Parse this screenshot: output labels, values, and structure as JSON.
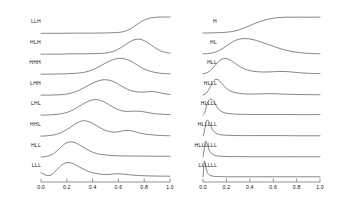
{
  "figure": {
    "background": "#ffffff",
    "line_color": "#3c3c3c",
    "axis_color": "#4a4a4a",
    "text_color": "#111111"
  },
  "chart_data": {
    "type": "line",
    "title": "",
    "xlabel": "",
    "ylabel": "",
    "grid": false,
    "legend": "none",
    "xlim": [
      0.0,
      1.0
    ],
    "panels": [
      {
        "name": "left-panel",
        "axis": {
          "xlim": [
            0.0,
            1.0
          ],
          "ticks": [
            0.0,
            0.2,
            0.4,
            0.6,
            0.8,
            1.0
          ],
          "tick_labels": [
            "0.0",
            "0.2",
            "0.4",
            "0.6",
            "0.8",
            "1.0"
          ]
        },
        "series": [
          {
            "name": "LLH",
            "label": "LLH",
            "peak_x": 0.83,
            "shape": "sigmoid-rise",
            "x": [
              0.0,
              0.05,
              0.1,
              0.15,
              0.2,
              0.25,
              0.3,
              0.35,
              0.4,
              0.45,
              0.5,
              0.55,
              0.6,
              0.63,
              0.66,
              0.69,
              0.72,
              0.75,
              0.78,
              0.81,
              0.84,
              0.87,
              0.9,
              0.95,
              1.0
            ],
            "y": [
              0.04,
              0.04,
              0.04,
              0.04,
              0.045,
              0.05,
              0.05,
              0.05,
              0.05,
              0.055,
              0.06,
              0.07,
              0.09,
              0.12,
              0.18,
              0.28,
              0.42,
              0.58,
              0.72,
              0.83,
              0.9,
              0.94,
              0.96,
              0.97,
              0.97
            ]
          },
          {
            "name": "HLH",
            "label": "HLH",
            "peak_x": 0.76,
            "shape": "broad-peak",
            "x": [
              0.0,
              0.05,
              0.1,
              0.15,
              0.2,
              0.25,
              0.3,
              0.35,
              0.4,
              0.45,
              0.5,
              0.55,
              0.58,
              0.62,
              0.66,
              0.7,
              0.74,
              0.78,
              0.82,
              0.86,
              0.9,
              0.94,
              1.0
            ],
            "y": [
              0.05,
              0.05,
              0.05,
              0.05,
              0.06,
              0.07,
              0.07,
              0.07,
              0.08,
              0.09,
              0.11,
              0.18,
              0.26,
              0.42,
              0.62,
              0.8,
              0.9,
              0.88,
              0.74,
              0.54,
              0.34,
              0.2,
              0.1
            ]
          },
          {
            "name": "HHH",
            "label": "HHH",
            "peak_x": 0.64,
            "shape": "broad-peak-with-shoulder",
            "x": [
              0.0,
              0.05,
              0.1,
              0.15,
              0.2,
              0.25,
              0.3,
              0.34,
              0.38,
              0.42,
              0.46,
              0.5,
              0.54,
              0.58,
              0.62,
              0.66,
              0.7,
              0.74,
              0.78,
              0.82,
              0.88,
              0.94,
              1.0
            ],
            "y": [
              0.05,
              0.05,
              0.055,
              0.06,
              0.07,
              0.09,
              0.12,
              0.16,
              0.24,
              0.36,
              0.52,
              0.68,
              0.82,
              0.92,
              0.95,
              0.9,
              0.78,
              0.6,
              0.42,
              0.28,
              0.15,
              0.09,
              0.07
            ]
          },
          {
            "name": "LHH",
            "label": "LHH",
            "peak_x": 0.5,
            "shape": "peak-plus-bump",
            "x": [
              0.0,
              0.05,
              0.1,
              0.14,
              0.18,
              0.22,
              0.26,
              0.3,
              0.34,
              0.38,
              0.42,
              0.46,
              0.5,
              0.54,
              0.58,
              0.62,
              0.66,
              0.7,
              0.74,
              0.78,
              0.82,
              0.86,
              0.9,
              0.95,
              1.0
            ],
            "y": [
              0.05,
              0.05,
              0.06,
              0.07,
              0.09,
              0.14,
              0.22,
              0.34,
              0.5,
              0.66,
              0.8,
              0.9,
              0.93,
              0.88,
              0.76,
              0.58,
              0.42,
              0.3,
              0.24,
              0.22,
              0.24,
              0.26,
              0.22,
              0.14,
              0.09
            ]
          },
          {
            "name": "LHL",
            "label": "LHL",
            "peak_x": 0.42,
            "shape": "peak-plus-bump",
            "x": [
              0.0,
              0.04,
              0.08,
              0.12,
              0.16,
              0.2,
              0.24,
              0.28,
              0.32,
              0.36,
              0.4,
              0.44,
              0.48,
              0.52,
              0.56,
              0.6,
              0.64,
              0.68,
              0.72,
              0.78,
              0.84,
              0.9,
              1.0
            ],
            "y": [
              0.05,
              0.055,
              0.07,
              0.09,
              0.13,
              0.2,
              0.32,
              0.48,
              0.66,
              0.82,
              0.92,
              0.93,
              0.84,
              0.68,
              0.5,
              0.36,
              0.28,
              0.26,
              0.28,
              0.26,
              0.18,
              0.12,
              0.08
            ]
          },
          {
            "name": "HHL",
            "label": "HHL",
            "peak_x": 0.33,
            "shape": "peak-plus-two-bumps",
            "x": [
              0.0,
              0.03,
              0.06,
              0.1,
              0.14,
              0.18,
              0.22,
              0.26,
              0.3,
              0.33,
              0.36,
              0.4,
              0.44,
              0.48,
              0.52,
              0.56,
              0.6,
              0.64,
              0.68,
              0.72,
              0.78,
              0.85,
              0.92,
              1.0
            ],
            "y": [
              0.05,
              0.06,
              0.08,
              0.12,
              0.2,
              0.34,
              0.52,
              0.72,
              0.88,
              0.93,
              0.9,
              0.78,
              0.6,
              0.44,
              0.33,
              0.28,
              0.3,
              0.36,
              0.38,
              0.32,
              0.2,
              0.13,
              0.09,
              0.07
            ]
          },
          {
            "name": "HLL",
            "label": "HLL",
            "peak_x": 0.22,
            "shape": "early-peak",
            "x": [
              0.0,
              0.03,
              0.06,
              0.09,
              0.12,
              0.15,
              0.18,
              0.21,
              0.24,
              0.27,
              0.3,
              0.34,
              0.38,
              0.42,
              0.46,
              0.52,
              0.58,
              0.64,
              0.72,
              0.8,
              0.9,
              1.0
            ],
            "y": [
              0.06,
              0.08,
              0.13,
              0.22,
              0.38,
              0.58,
              0.78,
              0.9,
              0.92,
              0.86,
              0.74,
              0.56,
              0.4,
              0.28,
              0.21,
              0.16,
              0.13,
              0.12,
              0.11,
              0.11,
              0.1,
              0.1
            ]
          },
          {
            "name": "LLL",
            "label": "LLL",
            "peak_x": 0.18,
            "shape": "dip-then-peak",
            "x": [
              0.0,
              0.02,
              0.04,
              0.06,
              0.08,
              0.1,
              0.13,
              0.16,
              0.19,
              0.22,
              0.25,
              0.28,
              0.32,
              0.36,
              0.4,
              0.46,
              0.52,
              0.58,
              0.64,
              0.72,
              0.8,
              0.9,
              1.0
            ],
            "y": [
              0.3,
              0.22,
              0.16,
              0.14,
              0.18,
              0.3,
              0.52,
              0.74,
              0.86,
              0.88,
              0.82,
              0.7,
              0.54,
              0.4,
              0.3,
              0.22,
              0.2,
              0.24,
              0.22,
              0.16,
              0.13,
              0.11,
              0.1
            ]
          }
        ]
      },
      {
        "name": "right-panel",
        "axis": {
          "xlim": [
            0.0,
            1.0
          ],
          "ticks": [
            0.0,
            0.2,
            0.4,
            0.6,
            0.8,
            1.0
          ],
          "tick_labels": [
            "0.0",
            "0.2",
            "0.4",
            "0.6",
            "0.8",
            "1.0"
          ]
        },
        "series": [
          {
            "name": "H",
            "label": "H",
            "peak_x": 0.62,
            "shape": "sigmoid-rise-plateau",
            "x": [
              0.0,
              0.05,
              0.1,
              0.15,
              0.2,
              0.25,
              0.3,
              0.35,
              0.4,
              0.45,
              0.5,
              0.55,
              0.6,
              0.65,
              0.7,
              0.75,
              0.8,
              0.85,
              0.9,
              0.95,
              1.0
            ],
            "y": [
              0.06,
              0.06,
              0.07,
              0.08,
              0.1,
              0.14,
              0.22,
              0.34,
              0.48,
              0.62,
              0.74,
              0.84,
              0.9,
              0.94,
              0.96,
              0.96,
              0.96,
              0.96,
              0.96,
              0.96,
              0.96
            ]
          },
          {
            "name": "HL",
            "label": "HL",
            "peak_x": 0.34,
            "shape": "broad-peak",
            "x": [
              0.0,
              0.04,
              0.08,
              0.12,
              0.16,
              0.2,
              0.24,
              0.28,
              0.32,
              0.36,
              0.4,
              0.44,
              0.48,
              0.54,
              0.6,
              0.66,
              0.72,
              0.78,
              0.85,
              0.92,
              1.0
            ],
            "y": [
              0.06,
              0.08,
              0.12,
              0.2,
              0.34,
              0.52,
              0.7,
              0.84,
              0.92,
              0.94,
              0.92,
              0.86,
              0.78,
              0.64,
              0.5,
              0.36,
              0.26,
              0.18,
              0.12,
              0.09,
              0.07
            ]
          },
          {
            "name": "HLL",
            "label": "HLL",
            "peak_x": 0.19,
            "shape": "peak-plus-bump",
            "x": [
              0.0,
              0.03,
              0.06,
              0.09,
              0.12,
              0.15,
              0.18,
              0.21,
              0.24,
              0.28,
              0.32,
              0.36,
              0.4,
              0.46,
              0.52,
              0.58,
              0.64,
              0.7,
              0.76,
              0.84,
              0.92,
              1.0
            ],
            "y": [
              0.07,
              0.12,
              0.24,
              0.44,
              0.68,
              0.86,
              0.94,
              0.92,
              0.82,
              0.64,
              0.46,
              0.33,
              0.25,
              0.19,
              0.17,
              0.18,
              0.2,
              0.2,
              0.17,
              0.12,
              0.09,
              0.08
            ]
          },
          {
            "name": "HLLL",
            "label": "HLLL",
            "peak_x": 0.12,
            "shape": "sharp-peak",
            "x": [
              0.0,
              0.02,
              0.04,
              0.06,
              0.08,
              0.1,
              0.12,
              0.14,
              0.16,
              0.19,
              0.22,
              0.26,
              0.3,
              0.36,
              0.42,
              0.48,
              0.54,
              0.6,
              0.68,
              0.78,
              0.88,
              1.0
            ],
            "y": [
              0.07,
              0.12,
              0.26,
              0.5,
              0.76,
              0.92,
              0.95,
              0.88,
              0.72,
              0.5,
              0.34,
              0.22,
              0.16,
              0.12,
              0.11,
              0.12,
              0.13,
              0.13,
              0.11,
              0.09,
              0.08,
              0.07
            ]
          },
          {
            "name": "HLLLL",
            "label": "HLLLL",
            "peak_x": 0.07,
            "shape": "very-sharp-peak",
            "x": [
              0.0,
              0.01,
              0.02,
              0.03,
              0.04,
              0.055,
              0.07,
              0.085,
              0.1,
              0.12,
              0.14,
              0.17,
              0.2,
              0.25,
              0.3,
              0.38,
              0.46,
              0.56,
              0.68,
              0.8,
              0.9,
              1.0
            ],
            "y": [
              0.07,
              0.14,
              0.32,
              0.58,
              0.8,
              0.93,
              0.96,
              0.88,
              0.72,
              0.5,
              0.34,
              0.22,
              0.16,
              0.12,
              0.1,
              0.09,
              0.09,
              0.09,
              0.09,
              0.08,
              0.08,
              0.08
            ]
          },
          {
            "name": "HLLLLL",
            "label": "HLLLLL",
            "peak_x": 0.04,
            "shape": "spike",
            "x": [
              0.0,
              0.008,
              0.016,
              0.024,
              0.032,
              0.042,
              0.052,
              0.064,
              0.078,
              0.095,
              0.115,
              0.14,
              0.18,
              0.24,
              0.32,
              0.42,
              0.54,
              0.68,
              0.82,
              1.0
            ],
            "y": [
              0.07,
              0.2,
              0.48,
              0.76,
              0.93,
              0.96,
              0.86,
              0.66,
              0.46,
              0.3,
              0.2,
              0.14,
              0.11,
              0.09,
              0.08,
              0.08,
              0.08,
              0.08,
              0.07,
              0.07
            ]
          },
          {
            "name": "HLLLLLL",
            "label": "HLLLLLL",
            "peak_x": 0.025,
            "shape": "narrow-spike",
            "x": [
              0.0,
              0.005,
              0.011,
              0.017,
              0.023,
              0.03,
              0.038,
              0.048,
              0.06,
              0.075,
              0.095,
              0.12,
              0.16,
              0.22,
              0.3,
              0.42,
              0.56,
              0.72,
              0.88,
              1.0
            ],
            "y": [
              0.07,
              0.24,
              0.58,
              0.86,
              0.96,
              0.92,
              0.76,
              0.54,
              0.36,
              0.24,
              0.16,
              0.12,
              0.1,
              0.08,
              0.08,
              0.07,
              0.07,
              0.07,
              0.07,
              0.07
            ]
          },
          {
            "name": "LLLLLL",
            "label": "LLLLLL",
            "peak_x": 0.012,
            "shape": "impulse",
            "x": [
              0.0,
              0.003,
              0.007,
              0.011,
              0.015,
              0.02,
              0.026,
              0.034,
              0.044,
              0.058,
              0.075,
              0.1,
              0.14,
              0.2,
              0.3,
              0.44,
              0.6,
              0.78,
              1.0
            ],
            "y": [
              0.07,
              0.3,
              0.72,
              0.96,
              0.94,
              0.8,
              0.58,
              0.38,
              0.24,
              0.16,
              0.12,
              0.09,
              0.08,
              0.07,
              0.07,
              0.07,
              0.07,
              0.07,
              0.07
            ]
          }
        ]
      }
    ]
  }
}
